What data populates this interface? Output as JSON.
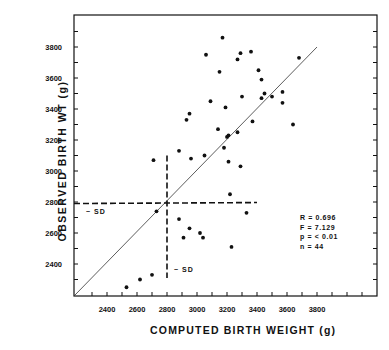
{
  "chart_data": {
    "type": "scatter",
    "title": "",
    "xlabel": "COMPUTED BIRTH WEIGHT (g)",
    "ylabel": "OBSERVED BIRTH WT (g)",
    "xlim": [
      2200,
      4200
    ],
    "ylim": [
      2200,
      4000
    ],
    "x_ticks": [
      2400,
      2600,
      2800,
      3000,
      3200,
      3400,
      3600,
      3800
    ],
    "x_tick_labels": [
      "2400",
      "2600",
      "2800",
      "3000",
      "3200",
      "3400",
      "3600",
      "3800"
    ],
    "y_ticks": [
      2400,
      2600,
      2800,
      3000,
      3200,
      3400,
      3600,
      3800
    ],
    "y_tick_labels": [
      "2400",
      "2600",
      "2800",
      "3000",
      "3200",
      "3400",
      "3600",
      "3800"
    ],
    "grid": false,
    "identity_line": {
      "from": [
        2200,
        2200
      ],
      "to": [
        3800,
        3800
      ]
    },
    "mean_lines": {
      "x": 2800,
      "y": 2790,
      "label": "~ SD"
    },
    "stats": {
      "R": "R = 0.696",
      "F": "F = 7.129",
      "p": "p = < 0.01",
      "n": "n = 44"
    },
    "points": [
      [
        2530,
        2250
      ],
      [
        2620,
        2300
      ],
      [
        2700,
        2330
      ],
      [
        2730,
        2740
      ],
      [
        2710,
        3070
      ],
      [
        2880,
        2690
      ],
      [
        2910,
        2570
      ],
      [
        2950,
        2630
      ],
      [
        3020,
        2600
      ],
      [
        3040,
        2570
      ],
      [
        2880,
        3130
      ],
      [
        2930,
        3330
      ],
      [
        2950,
        3370
      ],
      [
        2960,
        3080
      ],
      [
        3050,
        3100
      ],
      [
        3060,
        3750
      ],
      [
        3090,
        3450
      ],
      [
        3150,
        3640
      ],
      [
        3170,
        3860
      ],
      [
        3190,
        3410
      ],
      [
        3210,
        3060
      ],
      [
        3140,
        3270
      ],
      [
        3180,
        3150
      ],
      [
        3200,
        3220
      ],
      [
        3210,
        3230
      ],
      [
        3220,
        2850
      ],
      [
        3230,
        2510
      ],
      [
        3270,
        3250
      ],
      [
        3270,
        3720
      ],
      [
        3290,
        3760
      ],
      [
        3300,
        3480
      ],
      [
        3290,
        3030
      ],
      [
        3330,
        2730
      ],
      [
        3360,
        3770
      ],
      [
        3370,
        3320
      ],
      [
        3410,
        3650
      ],
      [
        3430,
        3590
      ],
      [
        3430,
        3470
      ],
      [
        3450,
        3500
      ],
      [
        3500,
        3480
      ],
      [
        3570,
        3510
      ],
      [
        3570,
        3440
      ],
      [
        3640,
        3300
      ],
      [
        3680,
        3730
      ]
    ]
  },
  "labels": {
    "ylabel": "OBSERVED  BIRTH  WT  (g)",
    "xlabel": "COMPUTED BIRTH  WEIGHT  (g)",
    "sd_horizontal": "~ SD",
    "sd_vertical": "~ SD"
  }
}
